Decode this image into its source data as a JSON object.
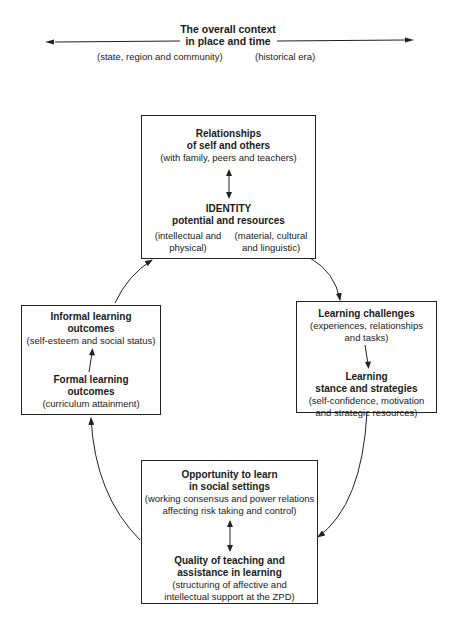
{
  "context": {
    "title_line1": "The overall context",
    "title_line2": "in place and time",
    "left_label": "(state, region and community)",
    "right_label": "(historical era)"
  },
  "boxes": {
    "identity": {
      "heading1": "Relationships",
      "heading2": "of self and others",
      "detail": "(with family, peers and teachers)",
      "heading3": "IDENTITY",
      "heading4": "potential and resources",
      "left_detail1": "(intellectual and",
      "left_detail2": "physical)",
      "right_detail1": "(material, cultural",
      "right_detail2": "and linguistic)"
    },
    "challenges": {
      "heading1": "Learning challenges",
      "detail1": "(experiences, relationships",
      "detail2": "and tasks)",
      "heading2": "Learning",
      "heading3": "stance and strategies",
      "detail3": "(self-confidence, motivation",
      "detail4": "and strategic resources)"
    },
    "opportunity": {
      "heading1": "Opportunity to learn",
      "heading2": "in social settings",
      "detail1": "(working consensus and power relations",
      "detail2": "affecting risk taking and control)",
      "heading3": "Quality of teaching and",
      "heading4": "assistance in learning",
      "detail3": "(structuring of affective and",
      "detail4": "intellectual support at the ZPD)"
    },
    "outcomes": {
      "heading1": "Informal learning",
      "heading2": "outcomes",
      "detail1": "(self-esteem and social status)",
      "heading3": "Formal learning",
      "heading4": "outcomes",
      "detail2": "(curriculum attainment)"
    }
  },
  "colors": {
    "line": "#222222",
    "text": "#1a1a1a",
    "background": "#ffffff"
  }
}
